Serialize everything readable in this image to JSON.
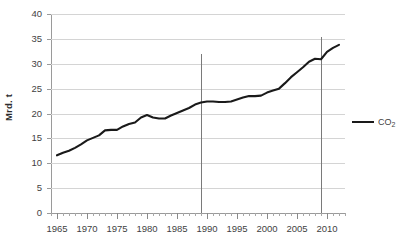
{
  "chart_data": {
    "type": "line",
    "title": "",
    "xlabel": "",
    "ylabel": "Mrd. t",
    "xlim": [
      1964,
      2013
    ],
    "ylim": [
      0,
      40
    ],
    "grid": true,
    "legend_position": "right",
    "x_tick_labels": [
      "1965",
      "1970",
      "1975",
      "1980",
      "1985",
      "1990",
      "1995",
      "2000",
      "2005",
      "2010"
    ],
    "x_ticks": [
      1965,
      1970,
      1975,
      1980,
      1985,
      1990,
      1995,
      2000,
      2005,
      2010
    ],
    "y_tick_labels": [
      "0",
      "5",
      "10",
      "15",
      "20",
      "25",
      "30",
      "35",
      "40"
    ],
    "y_ticks": [
      0,
      5,
      10,
      15,
      20,
      25,
      30,
      35,
      40
    ],
    "series": [
      {
        "name": "CO2",
        "label_html": "CO<sub>2</sub>",
        "color": "#1a1a1a",
        "x": [
          1965,
          1966,
          1967,
          1968,
          1969,
          1970,
          1971,
          1972,
          1973,
          1974,
          1975,
          1976,
          1977,
          1978,
          1979,
          1980,
          1981,
          1982,
          1983,
          1984,
          1985,
          1986,
          1987,
          1988,
          1989,
          1990,
          1991,
          1992,
          1993,
          1994,
          1995,
          1996,
          1997,
          1998,
          1999,
          2000,
          2001,
          2002,
          2003,
          2004,
          2005,
          2006,
          2007,
          2008,
          2009,
          2010,
          2011,
          2012
        ],
        "values": [
          11.6,
          12.1,
          12.5,
          13.1,
          13.8,
          14.6,
          15.1,
          15.6,
          16.6,
          16.7,
          16.7,
          17.4,
          17.9,
          18.2,
          19.2,
          19.7,
          19.2,
          19.0,
          19.0,
          19.6,
          20.1,
          20.6,
          21.1,
          21.8,
          22.2,
          22.4,
          22.4,
          22.3,
          22.3,
          22.4,
          22.8,
          23.2,
          23.5,
          23.5,
          23.6,
          24.2,
          24.6,
          25.0,
          26.1,
          27.3,
          28.3,
          29.3,
          30.4,
          31.0,
          30.9,
          32.4,
          33.2,
          33.8
        ]
      }
    ],
    "marker_lines": [
      {
        "name": "marker-1989",
        "x": 1989,
        "y_top": 32.0,
        "color": "#7a7a7a"
      },
      {
        "name": "marker-2009",
        "x": 2009,
        "y_top": 35.3,
        "color": "#7a7a7a"
      }
    ]
  },
  "legend": {
    "items": [
      {
        "label": "CO",
        "subscript": "2"
      }
    ]
  },
  "axes": {
    "y_title": "Mrd. t"
  }
}
